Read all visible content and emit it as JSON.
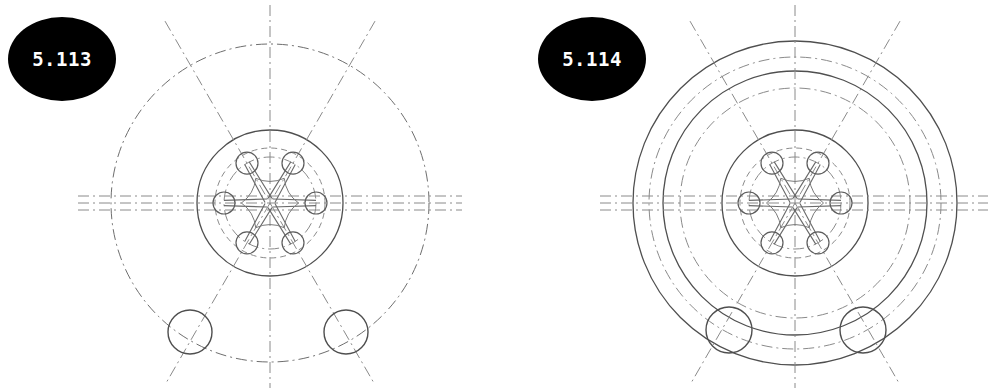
{
  "document": {
    "type": "engineering-drawing-plate",
    "background_color": "#ffffff",
    "width": 988,
    "height": 390,
    "line_color": "#5a5a5a",
    "faint_line_color": "#8d8d8d",
    "badge_fill": "#000000",
    "badge_text_color": "#ffffff"
  },
  "figures": [
    {
      "id": "fig-5113",
      "badge_label": "5.113",
      "title_label": "5.113",
      "view": "front-view",
      "center": {
        "x": 270,
        "y": 203
      },
      "circles": [
        {
          "name": "outer-bolt-reference-circle",
          "r": 159,
          "style": "dash-dot",
          "color": "#6e6e6e"
        },
        {
          "name": "hub-outer-circle",
          "r": 73,
          "style": "solid",
          "color": "#4f4f4f"
        },
        {
          "name": "hub-inner-dashed-circle",
          "r": 55,
          "style": "dashed",
          "color": "#8a8a8a"
        },
        {
          "name": "spoke-boss-pitch-circle",
          "r": 46,
          "style": "dash-dot",
          "color": "#8a8a8a"
        }
      ],
      "small_circles": [
        {
          "name": "bolt-hole-left",
          "cx": 190,
          "cy": 332,
          "r": 22
        },
        {
          "name": "bolt-hole-right",
          "cx": 346,
          "cy": 332,
          "r": 22
        }
      ],
      "spokes": {
        "count": 6,
        "hub_boss_radius": 11,
        "spoke_length": 46,
        "start_angle_deg": 0
      },
      "center_lines": {
        "vertical": {
          "style": "dash-dot",
          "from_y": 5,
          "to_y": 388
        },
        "horizontal_band": {
          "style": "dash-dot",
          "offsets": [
            -7,
            0,
            7
          ],
          "from_x": 78,
          "to_x": 462
        },
        "diagonals_deg": [
          60,
          120
        ]
      }
    },
    {
      "id": "fig-5114",
      "badge_label": "5.114",
      "title_label": "5.114",
      "view": "front-view",
      "center": {
        "x": 795,
        "y": 203
      },
      "circles": [
        {
          "name": "outermost-rim-circle",
          "r": 162,
          "style": "solid",
          "color": "#4f4f4f"
        },
        {
          "name": "outer-chain-reference-circle",
          "r": 146,
          "style": "dash-dot",
          "color": "#8a8a8a"
        },
        {
          "name": "middle-rim-circle",
          "r": 132,
          "style": "solid",
          "color": "#4f4f4f"
        },
        {
          "name": "inner-chain-reference-circle",
          "r": 115,
          "style": "dash-dot",
          "color": "#8a8a8a"
        },
        {
          "name": "hub-outer-circle",
          "r": 73,
          "style": "solid",
          "color": "#4f4f4f"
        },
        {
          "name": "hub-inner-dashed-circle",
          "r": 55,
          "style": "dashed",
          "color": "#8a8a8a"
        },
        {
          "name": "spoke-boss-pitch-circle",
          "r": 46,
          "style": "dash-dot",
          "color": "#8a8a8a"
        }
      ],
      "small_circles": [
        {
          "name": "bolt-hole-left",
          "cx": 729,
          "cy": 330,
          "r": 23
        },
        {
          "name": "bolt-hole-right",
          "cx": 863,
          "cy": 330,
          "r": 23
        }
      ],
      "spokes": {
        "count": 6,
        "hub_boss_radius": 11,
        "spoke_length": 46,
        "start_angle_deg": 0
      },
      "center_lines": {
        "vertical": {
          "style": "dash-dot",
          "from_y": 5,
          "to_y": 388
        },
        "horizontal_band": {
          "style": "dash-dot",
          "offsets": [
            -7,
            0,
            7
          ],
          "from_x": 600,
          "to_x": 988
        },
        "diagonals_deg": [
          60,
          120
        ]
      }
    }
  ]
}
